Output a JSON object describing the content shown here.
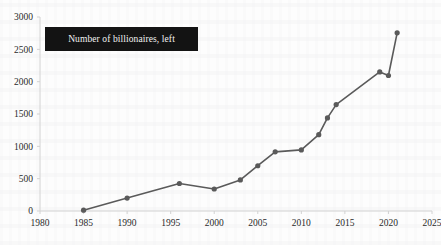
{
  "legend": {
    "label": "Number of billionaires, left",
    "position": "top-left-inside",
    "box_color": "#131313",
    "text_color": "#f2f2f2"
  },
  "style": {
    "series_color": "#5a5a5a",
    "axis_color": "#d2d2d2",
    "tick_text_color": "#2a2a2a",
    "background": "#fdfdfd"
  },
  "chart_data": {
    "type": "line",
    "title": "",
    "subtitle": "",
    "xlabel": "",
    "ylabel": "",
    "xlim": [
      1980,
      2025
    ],
    "ylim": [
      0,
      3000
    ],
    "grid": false,
    "legend_position": "top-left-inside",
    "xticks": [
      1980,
      1985,
      1990,
      1995,
      2000,
      2005,
      2010,
      2015,
      2020,
      2025
    ],
    "xtick_labels": [
      "1980",
      "1985",
      "1990",
      "1995",
      "2000",
      "2005",
      "2010",
      "2015",
      "2020",
      "2025"
    ],
    "yticks": [
      0,
      500,
      1000,
      1500,
      2000,
      2500,
      3000
    ],
    "ytick_labels": [
      "0",
      "500",
      "1000",
      "1500",
      "2000",
      "2500",
      "3000"
    ],
    "series": [
      {
        "name": "Number of billionaires, left",
        "color": "#5a5a5a",
        "marker": "circle",
        "x": [
          1985,
          1990,
          1996,
          2000,
          2003,
          2005,
          2007,
          2010,
          2012,
          2013,
          2014,
          2019,
          2020,
          2021
        ],
        "values": [
          13,
          200,
          425,
          340,
          480,
          700,
          915,
          945,
          1180,
          1440,
          1645,
          2150,
          2095,
          2755
        ]
      }
    ]
  }
}
